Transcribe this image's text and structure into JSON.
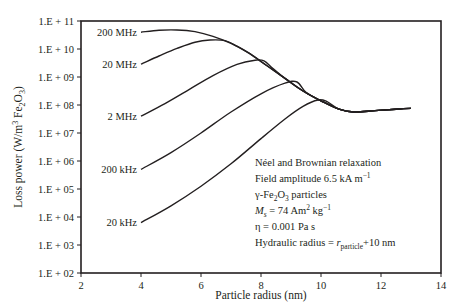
{
  "chart_data": {
    "type": "line",
    "title": "",
    "xlabel": "Particle radius (nm)",
    "ylabel": "Loss power (W/m³ Fe₂O₃)",
    "ylabel_parts": {
      "main": "Loss power (W/m",
      "sup": "3",
      "mid": " Fe",
      "sub1": "2",
      "o": "O",
      "sub2": "3",
      "end": ")"
    },
    "xlim": [
      2,
      14
    ],
    "ylim_log10": [
      2,
      11
    ],
    "yscale": "log",
    "grid": false,
    "x_ticks": [
      2,
      4,
      6,
      8,
      10,
      12,
      14
    ],
    "y_ticks": [
      "1.E + 02",
      "1.E + 03",
      "1.E + 04",
      "1.E + 05",
      "1.E + 06",
      "1.E + 07",
      "1.E + 08",
      "1.E + 09",
      "1.E + 10",
      "1.E + 11"
    ],
    "series": [
      {
        "name": "200 MHz",
        "label": "200 MHz",
        "points": [
          [
            4.0,
            10.6
          ],
          [
            4.6,
            10.67
          ],
          [
            5.2,
            10.68
          ],
          [
            5.8,
            10.62
          ],
          [
            6.4,
            10.45
          ],
          [
            7.0,
            10.2
          ],
          [
            7.6,
            9.85
          ],
          [
            8.2,
            9.4
          ],
          [
            8.8,
            8.95
          ],
          [
            9.4,
            8.5
          ],
          [
            10.0,
            8.15
          ],
          [
            10.6,
            7.85
          ],
          [
            11.1,
            7.75
          ],
          [
            11.8,
            7.8
          ],
          [
            12.5,
            7.85
          ],
          [
            13.0,
            7.88
          ]
        ]
      },
      {
        "name": "20 MHz",
        "label": "20 MHz",
        "points": [
          [
            4.0,
            9.46
          ],
          [
            4.6,
            9.75
          ],
          [
            5.2,
            10.02
          ],
          [
            5.8,
            10.24
          ],
          [
            6.3,
            10.32
          ],
          [
            6.8,
            10.3
          ],
          [
            7.2,
            10.1
          ],
          [
            7.6,
            9.85
          ],
          [
            8.2,
            9.4
          ],
          [
            8.8,
            8.95
          ],
          [
            9.4,
            8.5
          ],
          [
            10.0,
            8.15
          ],
          [
            10.6,
            7.85
          ],
          [
            11.1,
            7.75
          ],
          [
            11.8,
            7.8
          ],
          [
            12.5,
            7.85
          ],
          [
            13.0,
            7.88
          ]
        ]
      },
      {
        "name": "2 MHz",
        "label": "2 MHz",
        "points": [
          [
            4.0,
            7.6
          ],
          [
            4.8,
            8.05
          ],
          [
            5.6,
            8.55
          ],
          [
            6.4,
            9.05
          ],
          [
            7.2,
            9.45
          ],
          [
            7.8,
            9.6
          ],
          [
            8.1,
            9.58
          ],
          [
            8.4,
            9.3
          ],
          [
            8.8,
            8.95
          ],
          [
            9.4,
            8.5
          ],
          [
            10.0,
            8.15
          ],
          [
            10.6,
            7.85
          ],
          [
            11.1,
            7.75
          ],
          [
            11.8,
            7.8
          ],
          [
            12.5,
            7.85
          ],
          [
            13.0,
            7.88
          ]
        ]
      },
      {
        "name": "200 kHz",
        "label": "200 kHz",
        "points": [
          [
            4.0,
            5.7
          ],
          [
            5.0,
            6.3
          ],
          [
            6.0,
            7.0
          ],
          [
            7.0,
            7.75
          ],
          [
            8.0,
            8.4
          ],
          [
            8.8,
            8.78
          ],
          [
            9.2,
            8.82
          ],
          [
            9.5,
            8.45
          ],
          [
            10.0,
            8.15
          ],
          [
            10.6,
            7.85
          ],
          [
            11.1,
            7.75
          ],
          [
            11.8,
            7.8
          ],
          [
            12.5,
            7.85
          ],
          [
            13.0,
            7.88
          ]
        ]
      },
      {
        "name": "20 kHz",
        "label": "20 kHz",
        "points": [
          [
            4.0,
            3.8
          ],
          [
            5.0,
            4.4
          ],
          [
            6.0,
            5.1
          ],
          [
            7.0,
            5.9
          ],
          [
            8.0,
            6.8
          ],
          [
            8.8,
            7.5
          ],
          [
            9.4,
            7.95
          ],
          [
            9.9,
            8.18
          ],
          [
            10.2,
            8.12
          ],
          [
            10.6,
            7.85
          ],
          [
            11.1,
            7.75
          ],
          [
            11.8,
            7.8
          ],
          [
            12.5,
            7.85
          ],
          [
            13.0,
            7.88
          ]
        ]
      }
    ],
    "annotations": [
      "Néel and Brownian relaxation",
      "Field amplitude 6.5 kA m⁻¹",
      "γ-Fe₂O₃ particles",
      "Ms = 74 Am² kg⁻¹",
      "η = 0.001 Pa s",
      "Hydraulic radius = r_particle+10 nm"
    ]
  },
  "annotation_box": {
    "line1": "Néel and Brownian relaxation",
    "line2_main": "Field amplitude 6.5 kA m",
    "line2_sup": "−1",
    "line3_a": "γ-Fe",
    "line3_sub1": "2",
    "line3_b": "O",
    "line3_sub2": "3",
    "line3_c": " particles",
    "line4_m": "M",
    "line4_s": "s",
    "line4_mid": " = 74 Am",
    "line4_sup1": "2",
    "line4_kg": " kg",
    "line4_sup2": "−1",
    "line5": "η = 0.001 Pa s",
    "line6_a": "Hydraulic radius = ",
    "line6_r": "r",
    "line6_sub": "particle",
    "line6_b": "+10 nm"
  }
}
